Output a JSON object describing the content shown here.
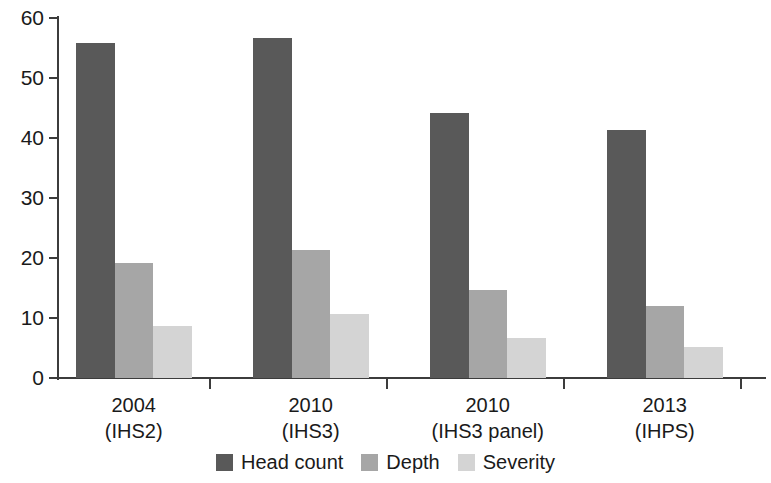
{
  "chart_data": {
    "type": "bar",
    "title": "",
    "subtitle": "",
    "xlabel": "",
    "ylabel": "",
    "ylim": [
      0,
      60
    ],
    "yticks": [
      0,
      10,
      20,
      30,
      40,
      50,
      60
    ],
    "ytick_labels": [
      "0",
      "10",
      "20",
      "30",
      "40",
      "50",
      "60"
    ],
    "grid": false,
    "legend_position": "bottom-center",
    "categories": [
      {
        "line1": "2004",
        "line2": "(IHS2)"
      },
      {
        "line1": "2010",
        "line2": "(IHS3)"
      },
      {
        "line1": "2010",
        "line2": "(IHS3 panel)"
      },
      {
        "line1": "2013",
        "line2": "(IHPS)"
      }
    ],
    "series": [
      {
        "name": "Head count",
        "color": "#595959",
        "values": [
          55.9,
          56.6,
          44.2,
          41.3
        ]
      },
      {
        "name": "Depth",
        "color": "#a6a6a6",
        "values": [
          19.1,
          21.4,
          14.6,
          12.0
        ]
      },
      {
        "name": "Severity",
        "color": "#d4d4d4",
        "values": [
          8.7,
          10.7,
          6.7,
          5.2
        ]
      }
    ]
  },
  "legend": {
    "items": [
      {
        "label": "Head count",
        "color": "#595959"
      },
      {
        "label": "Depth",
        "color": "#a6a6a6"
      },
      {
        "label": "Severity",
        "color": "#d4d4d4"
      }
    ]
  },
  "axis_colors": {
    "line": "#3c3c3c",
    "text": "#1a1a1a",
    "background": "#ffffff"
  }
}
